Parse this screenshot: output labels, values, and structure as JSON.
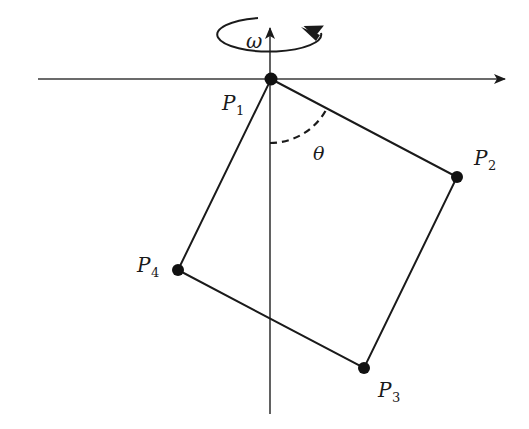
{
  "figure": {
    "kind": "rotating square pendulum diagram",
    "background": "#ffffff",
    "stroke_color": "#1a1a1a"
  },
  "labels": {
    "omega": "ω",
    "theta": "θ",
    "p1": {
      "main": "P",
      "sub": "1"
    },
    "p2": {
      "main": "P",
      "sub": "2"
    },
    "p3": {
      "main": "P",
      "sub": "3"
    },
    "p4": {
      "main": "P",
      "sub": "4"
    }
  },
  "points": {
    "P1": [
      271,
      79
    ],
    "P2": [
      457,
      177
    ],
    "P3": [
      364,
      368
    ],
    "P4": [
      178,
      270
    ]
  },
  "axes": {
    "horizontal": {
      "y": 79,
      "x_start": 38,
      "x_end": 505,
      "arrow": "right"
    },
    "vertical": {
      "x": 270,
      "y_start": 414,
      "y_end": 27,
      "arrow": "up"
    }
  }
}
